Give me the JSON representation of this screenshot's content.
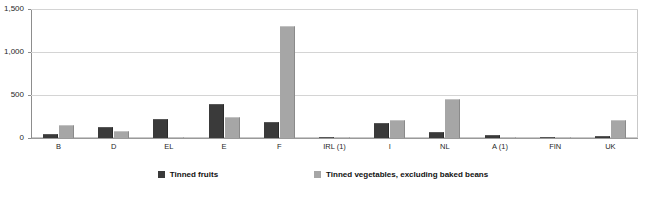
{
  "chart_data": {
    "type": "bar",
    "title": "",
    "subtitle": "",
    "xlabel": "",
    "ylabel": "",
    "ylim": [
      0,
      1500
    ],
    "yticks": [
      "0",
      "500",
      "1,000",
      "1,500"
    ],
    "ytick_values": [
      0,
      500,
      1000,
      1500
    ],
    "grid": true,
    "legend_position": "bottom",
    "categories": [
      "B",
      "D",
      "EL",
      "E",
      "F",
      "IRL (1)",
      "I",
      "NL",
      "A (1)",
      "FIN",
      "UK"
    ],
    "series": [
      {
        "name": "Tinned fruits",
        "color": "#3a3a3a",
        "values": [
          50,
          130,
          220,
          400,
          190,
          10,
          180,
          75,
          30,
          10,
          25
        ]
      },
      {
        "name": "Tinned vegetables, excluding baked beans",
        "color": "#a6a6a6",
        "values": [
          150,
          85,
          10,
          245,
          1300,
          15,
          215,
          450,
          5,
          12,
          205
        ]
      }
    ]
  },
  "legend": {
    "items": [
      {
        "label": "Tinned fruits"
      },
      {
        "label": "Tinned vegetables, excluding baked beans"
      }
    ]
  }
}
